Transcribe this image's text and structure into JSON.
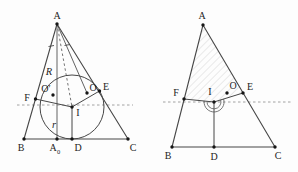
{
  "colors": {
    "background": "#fdfdfd",
    "line": "#474747",
    "dashed_guide": "#8a8a8a",
    "dot": "#161616",
    "hatch": "#d9d9d9",
    "label_text": "#1d1d1d"
  },
  "left_diagram": {
    "point_labels": {
      "A": "A",
      "B": "B",
      "C": "C",
      "A0_base": "A",
      "A0_sub": "0",
      "D": "D",
      "F": "F",
      "E": "E",
      "I": "I",
      "O_prime": "O′",
      "O": "O"
    },
    "measure_labels": {
      "R": "R",
      "r": "r"
    }
  },
  "right_diagram": {
    "point_labels": {
      "A": "A",
      "B": "B",
      "C": "C",
      "D": "D",
      "F": "F",
      "E": "E",
      "I": "I",
      "O": "O"
    }
  }
}
